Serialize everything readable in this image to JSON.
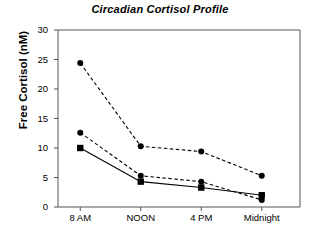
{
  "chart_data": {
    "type": "line",
    "title": "Circadian Cortisol Profile",
    "xlabel": "",
    "ylabel": "Free Cortisol (nM)",
    "categories": [
      "8 AM",
      "NOON",
      "4 PM",
      "Midnight"
    ],
    "ylim": [
      0,
      30
    ],
    "yticks": [
      0,
      5,
      10,
      15,
      20,
      25,
      30
    ],
    "ytick_labels": [
      "0",
      "5",
      "10",
      "15",
      "20",
      "25",
      "30"
    ],
    "grid": false,
    "legend": "none",
    "series": [
      {
        "name": "series-1",
        "marker": "circle",
        "line_style": "dashed",
        "color": "#000000",
        "values": [
          24.4,
          10.3,
          9.4,
          5.3
        ]
      },
      {
        "name": "series-2",
        "marker": "circle",
        "line_style": "dashed",
        "color": "#000000",
        "values": [
          12.6,
          5.3,
          4.3,
          1.2
        ]
      },
      {
        "name": "series-3",
        "marker": "square",
        "line_style": "solid",
        "color": "#000000",
        "values": [
          10.0,
          4.3,
          3.3,
          2.0
        ]
      }
    ]
  },
  "axes": {
    "frame_color": "#555555"
  }
}
